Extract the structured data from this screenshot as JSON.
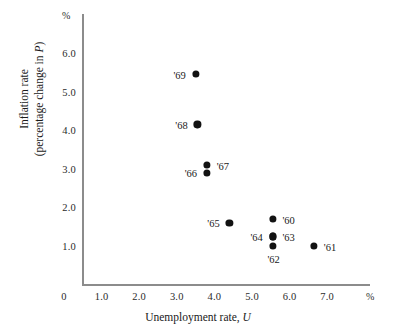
{
  "chart_data": {
    "type": "scatter",
    "title": "",
    "xlabel": "Unemployment rate, U",
    "ylabel": "Inflation rate (percentage change in P)",
    "ylabel_line1": "Inflation rate",
    "ylabel_line2_prefix": "(percentage change in ",
    "ylabel_line2_italic": "P",
    "ylabel_line2_suffix": ")",
    "xlabel_prefix": "Unemployment rate, ",
    "xlabel_italic": "U",
    "x_unit_mark": "%",
    "y_unit_mark": "%",
    "xlim": [
      0,
      7.6
    ],
    "ylim": [
      0,
      6.6
    ],
    "grid": false,
    "legend": "none",
    "xticks": [
      "0",
      "1.0",
      "2.0",
      "3.0",
      "4.0",
      "5.0",
      "6.0",
      "7.0"
    ],
    "xtick_values": [
      0,
      1.0,
      2.0,
      3.0,
      4.0,
      5.0,
      6.0,
      7.0
    ],
    "yticks": [
      "1.0",
      "2.0",
      "3.0",
      "4.0",
      "5.0",
      "6.0"
    ],
    "ytick_values": [
      1.0,
      2.0,
      3.0,
      4.0,
      5.0,
      6.0
    ],
    "point_color": "#121212",
    "axis_color": "#8c8c8c",
    "points": [
      {
        "label": "'60",
        "x": 5.55,
        "y": 1.75,
        "label_pos": "right"
      },
      {
        "label": "'61",
        "x": 6.65,
        "y": 1.05,
        "label_pos": "right"
      },
      {
        "label": "'62",
        "x": 5.55,
        "y": 1.05,
        "label_pos": "below"
      },
      {
        "label": "'63",
        "x": 5.55,
        "y": 1.3,
        "label_pos": "right"
      },
      {
        "label": "'64",
        "x": 5.55,
        "y": 1.3,
        "label_pos": "left"
      },
      {
        "label": "'65",
        "x": 4.4,
        "y": 1.65,
        "label_pos": "left"
      },
      {
        "label": "'66",
        "x": 3.8,
        "y": 2.95,
        "label_pos": "left"
      },
      {
        "label": "'67",
        "x": 3.8,
        "y": 3.15,
        "label_pos": "right"
      },
      {
        "label": "'68",
        "x": 3.55,
        "y": 4.2,
        "label_pos": "left"
      },
      {
        "label": "'69",
        "x": 3.5,
        "y": 5.5,
        "label_pos": "left"
      }
    ]
  }
}
